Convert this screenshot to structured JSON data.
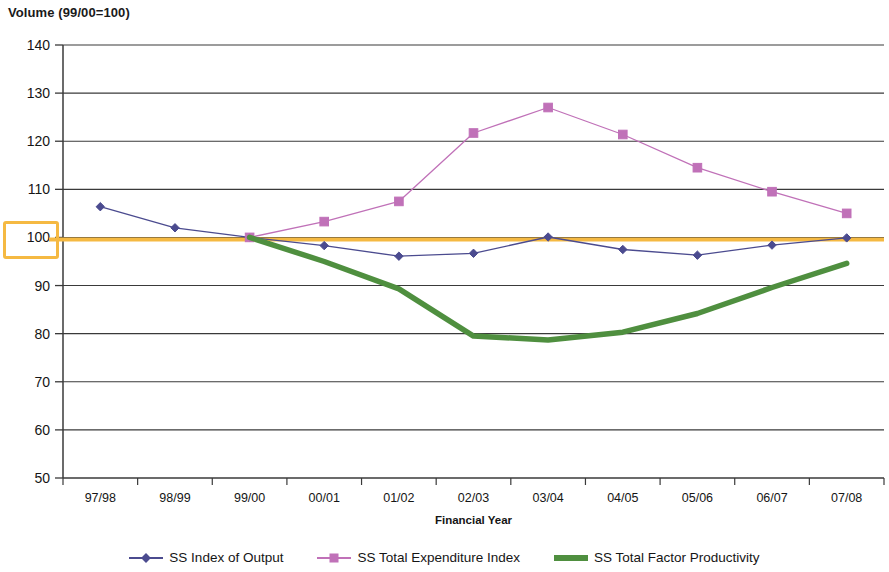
{
  "chart_data": {
    "type": "line",
    "title": "Volume (99/00=100)",
    "xlabel": "Financial Year",
    "ylabel": "",
    "categories": [
      "97/98",
      "98/99",
      "99/00",
      "00/01",
      "01/02",
      "02/03",
      "03/04",
      "04/05",
      "05/06",
      "06/07",
      "07/08"
    ],
    "ylim": [
      50,
      140
    ],
    "yticks": [
      50,
      60,
      70,
      80,
      90,
      100,
      110,
      120,
      130,
      140
    ],
    "grid": true,
    "legend_position": "bottom",
    "reference_line": {
      "value": 100,
      "color": "#f5b942"
    },
    "highlighted_ytick": "100",
    "series": [
      {
        "name": "SS Index of Output",
        "color": "#4b4b8f",
        "marker": "diamond",
        "line_width": 1.3,
        "values": [
          106.4,
          102.0,
          100.0,
          98.3,
          96.1,
          96.7,
          100.1,
          97.5,
          96.3,
          98.4,
          99.9
        ]
      },
      {
        "name": "SS Total Expenditure Index",
        "color": "#c071b8",
        "marker": "square",
        "line_width": 1.3,
        "values": [
          null,
          null,
          100.0,
          103.3,
          107.5,
          121.7,
          127.0,
          121.4,
          114.5,
          109.5,
          105.0
        ]
      },
      {
        "name": "SS Total Factor Productivity",
        "color": "#4f8f3f",
        "marker": "none",
        "line_width": 5.5,
        "values": [
          null,
          null,
          100.0,
          95.0,
          89.3,
          79.5,
          78.7,
          80.3,
          84.2,
          89.6,
          94.6
        ]
      }
    ]
  },
  "title": "Volume (99/00=100)",
  "axis": {
    "x_title": "Financial Year"
  }
}
